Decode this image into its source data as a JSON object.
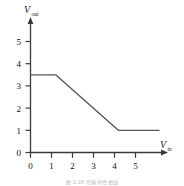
{
  "figure": {
    "caption": "图 3-28  传输特性曲线",
    "background_color": "#ffffff",
    "line_color": "#555555",
    "axis_color": "#3a3a3a"
  },
  "axes": {
    "y_label_main": "V",
    "y_label_sub": "out",
    "x_label_main": "V",
    "x_label_sub": "in",
    "y_ticks": [
      "0",
      "1",
      "2",
      "3",
      "4",
      "5"
    ],
    "x_ticks": [
      "0",
      "1",
      "2",
      "3",
      "4",
      "5"
    ]
  },
  "chart_data": {
    "type": "line",
    "title": "",
    "xlabel": "V_in",
    "ylabel": "V_out",
    "xlim": [
      0,
      5
    ],
    "ylim": [
      0,
      5
    ],
    "grid": false,
    "legend": "none",
    "series": [
      {
        "name": "transfer-characteristic",
        "x": [
          0,
          1,
          3.5,
          5
        ],
        "y": [
          3.5,
          3.5,
          1,
          1
        ]
      }
    ],
    "annotations": [
      {
        "text": "flat high region",
        "x_range": [
          0,
          1
        ],
        "y": 3.5
      },
      {
        "text": "linear falling region",
        "x_range": [
          1,
          3.5
        ],
        "y_range": [
          3.5,
          1
        ]
      },
      {
        "text": "flat low region",
        "x_range": [
          3.5,
          5
        ],
        "y": 1
      }
    ]
  }
}
